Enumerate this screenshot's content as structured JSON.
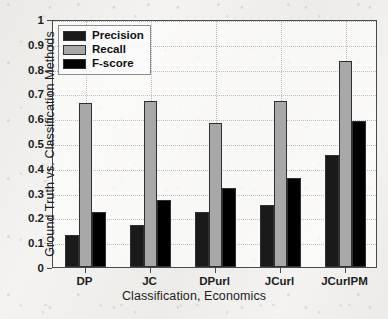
{
  "chart_data": {
    "type": "bar",
    "title": "",
    "xlabel": "Classification, Economics",
    "ylabel": "Ground Truth vs. Classification Methods",
    "categories": [
      "DP",
      "JC",
      "DPurl",
      "JCurl",
      "JCurlPM"
    ],
    "series": [
      {
        "name": "Precision",
        "color": "#1a1a1a",
        "values": [
          0.13,
          0.17,
          0.22,
          0.25,
          0.45
        ]
      },
      {
        "name": "Recall",
        "color": "#a8a8a8",
        "values": [
          0.66,
          0.67,
          0.58,
          0.67,
          0.83
        ]
      },
      {
        "name": "F-score",
        "color": "#000000",
        "values": [
          0.22,
          0.27,
          0.32,
          0.36,
          0.59
        ]
      }
    ],
    "ylim": [
      0,
      1
    ],
    "yticks": [
      0,
      0.1,
      0.2,
      0.3,
      0.4,
      0.5,
      0.6,
      0.7,
      0.8,
      0.9,
      1
    ],
    "ytick_labels": [
      "0",
      "0.1",
      "0.2",
      "0.3",
      "0.4",
      "0.5",
      "0.6",
      "0.7",
      "0.8",
      "0.9",
      "1"
    ],
    "grid": true,
    "grid_style": "dotted",
    "legend_position": "upper left",
    "axis_color": "#4a4a4a",
    "grid_color": "#bdbdbd",
    "background_color": "#f3f2f0"
  }
}
